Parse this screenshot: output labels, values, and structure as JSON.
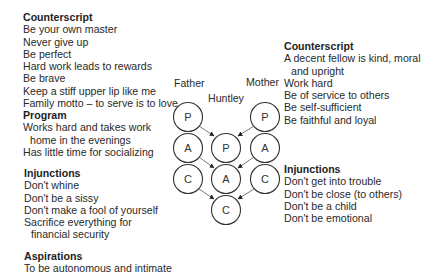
{
  "father": {
    "label": "Father",
    "counterscript": {
      "title": "Counterscript",
      "items": [
        "Be your own master",
        "Never give up",
        "Be perfect",
        "Hard work leads to rewards",
        "Be brave",
        "Keep a stiff upper lip like me",
        "Family motto – to serve is to love"
      ]
    },
    "program": {
      "title": "Program",
      "items": [
        "Works hard and takes work",
        "home in the evenings",
        "Has little time for socializing"
      ]
    },
    "injunctions": {
      "title": "Injunctions",
      "items": [
        "Don't whine",
        "Don't be a sissy",
        "Don't make a fool of yourself",
        "Sacrifice everything for",
        "financial security"
      ]
    },
    "aspirations": {
      "title": "Aspirations",
      "items": [
        "To be autonomous and intimate"
      ]
    },
    "ego_states": [
      "P",
      "A",
      "C"
    ]
  },
  "mother": {
    "label": "Mother",
    "counterscript": {
      "title": "Counterscript",
      "items": [
        "A decent fellow is kind, moral",
        "and upright",
        "Work hard",
        "Be of service to others",
        "Be self-sufficient",
        "Be faithful and loyal"
      ]
    },
    "injunctions": {
      "title": "Injunctions",
      "items": [
        "Don't get into trouble",
        "Don't be close (to others)",
        "Don't be a child",
        "Don't be emotional"
      ]
    },
    "ego_states": [
      "P",
      "A",
      "C"
    ]
  },
  "child": {
    "label": "Huntley",
    "ego_states": [
      "P",
      "A",
      "C"
    ]
  }
}
